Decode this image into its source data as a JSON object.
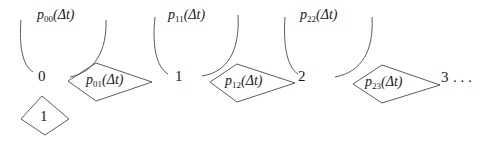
{
  "diagram": {
    "type": "state-transition",
    "states": [
      {
        "id": "s0",
        "label": "0"
      },
      {
        "id": "s1",
        "label": "1"
      },
      {
        "id": "s2",
        "label": "2"
      },
      {
        "id": "s3",
        "label": "3"
      }
    ],
    "continuation": ". . .",
    "self_loops": [
      {
        "from": "0",
        "to": "0",
        "p": "p",
        "sub": "00",
        "arg": "(Δt)"
      },
      {
        "from": "1",
        "to": "1",
        "p": "p",
        "sub": "11",
        "arg": "(Δt)"
      },
      {
        "from": "2",
        "to": "2",
        "p": "p",
        "sub": "22",
        "arg": "(Δt)"
      }
    ],
    "transitions": [
      {
        "from": "0",
        "to": "1",
        "p": "p",
        "sub": "01",
        "arg": "(Δt)"
      },
      {
        "from": "1",
        "to": "2",
        "p": "p",
        "sub": "12",
        "arg": "(Δt)"
      },
      {
        "from": "2",
        "to": "3",
        "p": "p",
        "sub": "23",
        "arg": "(Δt)"
      }
    ],
    "below_node": {
      "label": "1"
    },
    "colors": {
      "stroke": "#4a4a4a",
      "text": "#1a1a1a",
      "background": "#ffffff"
    }
  }
}
